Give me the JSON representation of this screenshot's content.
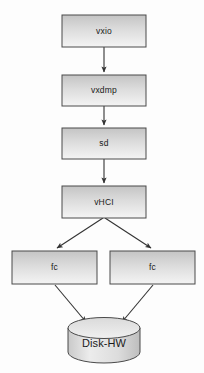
{
  "diagram": {
    "type": "flowchart",
    "background_color": "#fdfdfd",
    "box_stroke_color": "#4a4a4a",
    "box_fill_top_color": "#c9c9c9",
    "box_fill_bottom_color": "#f2f2f2",
    "arrow_color": "#333333",
    "text_color": "#1a1a1a",
    "nodes": [
      {
        "id": "vxio",
        "label": "vxio",
        "shape": "rectangle",
        "x": 62,
        "y": 15,
        "width": 84,
        "height": 32
      },
      {
        "id": "vxdmp",
        "label": "vxdmp",
        "shape": "rectangle",
        "x": 62,
        "y": 75,
        "width": 84,
        "height": 31
      },
      {
        "id": "sd",
        "label": "sd",
        "shape": "rectangle",
        "x": 62,
        "y": 128,
        "width": 84,
        "height": 31
      },
      {
        "id": "vhci",
        "label": "vHCI",
        "shape": "rectangle",
        "x": 62,
        "y": 186,
        "width": 84,
        "height": 32
      },
      {
        "id": "fc_left",
        "label": "fc",
        "shape": "rectangle",
        "x": 12,
        "y": 251,
        "width": 85,
        "height": 33
      },
      {
        "id": "fc_right",
        "label": "fc",
        "shape": "rectangle",
        "x": 110,
        "y": 251,
        "width": 85,
        "height": 33
      },
      {
        "id": "disk",
        "label": "Disk-HW",
        "shape": "cylinder",
        "x": 68,
        "y": 318,
        "width": 72,
        "height": 45
      }
    ],
    "edges": [
      {
        "from": "vxio",
        "to": "vxdmp",
        "style": "arrow",
        "direction": "down"
      },
      {
        "from": "vxdmp",
        "to": "sd",
        "style": "arrow",
        "direction": "down"
      },
      {
        "from": "sd",
        "to": "vhci",
        "style": "arrow",
        "direction": "down"
      },
      {
        "from": "vhci",
        "to": "fc_left",
        "style": "arrow",
        "direction": "down-left"
      },
      {
        "from": "vhci",
        "to": "fc_right",
        "style": "arrow",
        "direction": "down-right"
      },
      {
        "from": "fc_left",
        "to": "disk",
        "style": "arrow",
        "direction": "down-right"
      },
      {
        "from": "fc_right",
        "to": "disk",
        "style": "arrow",
        "direction": "down-left"
      }
    ]
  }
}
